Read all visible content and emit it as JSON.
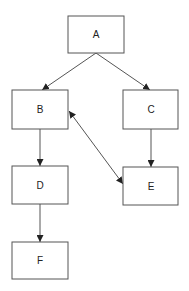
{
  "diagram": {
    "type": "directed-graph",
    "colors": {
      "stroke": "#555555",
      "text": "#222222",
      "fill": "#ffffff"
    },
    "nodes": [
      {
        "id": "A",
        "label": "A",
        "x": 68,
        "y": 16,
        "w": 56,
        "h": 37
      },
      {
        "id": "B",
        "label": "B",
        "x": 12,
        "y": 90,
        "w": 56,
        "h": 39
      },
      {
        "id": "C",
        "label": "C",
        "x": 123,
        "y": 90,
        "w": 55,
        "h": 39
      },
      {
        "id": "D",
        "label": "D",
        "x": 12,
        "y": 166,
        "w": 56,
        "h": 38
      },
      {
        "id": "E",
        "label": "E",
        "x": 123,
        "y": 167,
        "w": 55,
        "h": 38
      },
      {
        "id": "F",
        "label": "F",
        "x": 12,
        "y": 242,
        "w": 56,
        "h": 37
      }
    ],
    "edges": [
      {
        "from": "A",
        "to": "B",
        "bidirectional": false
      },
      {
        "from": "A",
        "to": "C",
        "bidirectional": false
      },
      {
        "from": "B",
        "to": "D",
        "bidirectional": false
      },
      {
        "from": "C",
        "to": "E",
        "bidirectional": false
      },
      {
        "from": "D",
        "to": "F",
        "bidirectional": false
      },
      {
        "from": "B",
        "to": "E",
        "bidirectional": true
      }
    ]
  }
}
